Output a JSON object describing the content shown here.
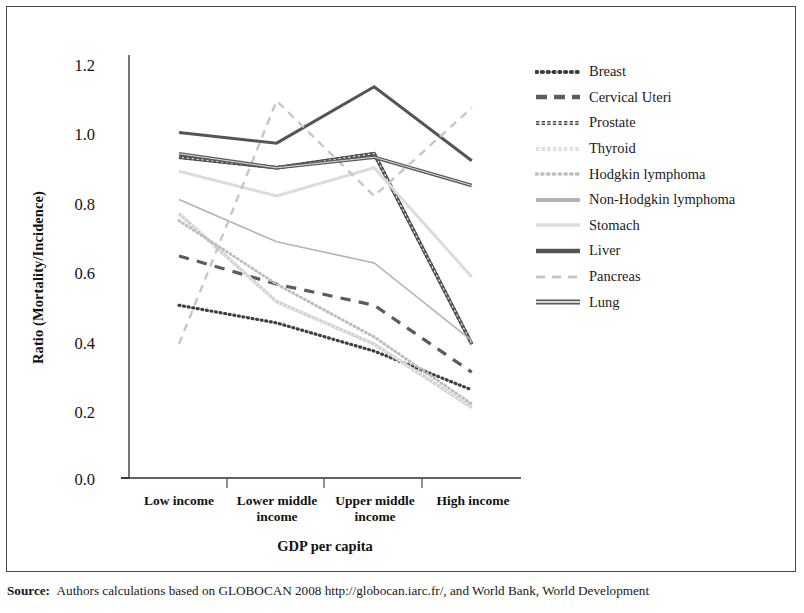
{
  "chart_data": {
    "type": "line",
    "title": "",
    "xlabel": "GDP per capita",
    "ylabel": "Ratio (Mortality/Incidence)",
    "categories": [
      "Low income",
      "Lower middle income",
      "Upper middle income",
      "High income"
    ],
    "ylim": [
      0.0,
      1.2
    ],
    "yticks": [
      "0.0",
      "0.2",
      "0.4",
      "0.6",
      "0.8",
      "1.0",
      "1.2"
    ],
    "ytick_values": [
      0.0,
      0.2,
      0.4,
      0.6,
      0.8,
      1.0,
      1.2
    ],
    "grid": false,
    "legend_position": "right",
    "series": [
      {
        "name": "Breast",
        "values": [
          0.49,
          0.44,
          0.36,
          0.25
        ],
        "style": "dotted",
        "color": "#3f3f3f",
        "width": 3.2
      },
      {
        "name": "Cervical Uteri",
        "values": [
          0.63,
          0.55,
          0.49,
          0.3
        ],
        "style": "dashed",
        "color": "#5c5c5c",
        "width": 3.2
      },
      {
        "name": "Prostate",
        "values": [
          0.91,
          0.88,
          0.92,
          0.38
        ],
        "style": "double-thin",
        "color": "#4a4a4a",
        "width": 3.4
      },
      {
        "name": "Thyroid",
        "values": [
          0.75,
          0.5,
          0.38,
          0.2
        ],
        "style": "double-thin",
        "color": "#cfcfcf",
        "width": 3.0
      },
      {
        "name": "Hodgkin lymphoma",
        "values": [
          0.73,
          0.55,
          0.4,
          0.21
        ],
        "style": "dotted",
        "color": "#bdbdbd",
        "width": 3.0
      },
      {
        "name": "Non-Hodgkin lymphoma",
        "values": [
          0.79,
          0.67,
          0.61,
          0.39
        ],
        "style": "solid",
        "color": "#b3b3b3",
        "width": 1.6
      },
      {
        "name": "Stomach",
        "values": [
          0.87,
          0.8,
          0.88,
          0.57
        ],
        "style": "solid",
        "color": "#dcdcdc",
        "width": 3.0
      },
      {
        "name": "Liver",
        "values": [
          0.98,
          0.95,
          1.11,
          0.9
        ],
        "style": "solid",
        "color": "#555555",
        "width": 3.0
      },
      {
        "name": "Pancreas",
        "values": [
          0.38,
          1.07,
          0.8,
          1.05
        ],
        "style": "dashed",
        "color": "#c6c6c6",
        "width": 2.4
      },
      {
        "name": "Lung",
        "values": [
          0.92,
          0.88,
          0.91,
          0.83
        ],
        "style": "solid-double",
        "color": "#5a5a5a",
        "width": 3.6
      }
    ]
  },
  "axes": {
    "x_title": "GDP per capita",
    "y_title": "Ratio (Mortality/Incidence)"
  },
  "legend": {
    "entries": [
      {
        "label": "Breast",
        "swatch": "dotted-thick-dark"
      },
      {
        "label": "Cervical Uteri",
        "swatch": "dashed-thick-dark"
      },
      {
        "label": "Prostate",
        "swatch": "double-wave-dark"
      },
      {
        "label": "Thyroid",
        "swatch": "double-wave-light"
      },
      {
        "label": "Hodgkin lymphoma",
        "swatch": "dotted-thick-light"
      },
      {
        "label": "Non-Hodgkin lymphoma",
        "swatch": "solid-thick-light"
      },
      {
        "label": "Stomach",
        "swatch": "solid-thick-verylight"
      },
      {
        "label": "Liver",
        "swatch": "solid-thick-dark"
      },
      {
        "label": "Pancreas",
        "swatch": "dashed-thin-light"
      },
      {
        "label": "Lung",
        "swatch": "solid-double-dark"
      }
    ]
  },
  "source": {
    "bold_prefix": "Source:",
    "text": "Authors calculations based on GLOBOCAN 2008 http://globocan.iarc.fr/, and World Bank, World Development"
  }
}
